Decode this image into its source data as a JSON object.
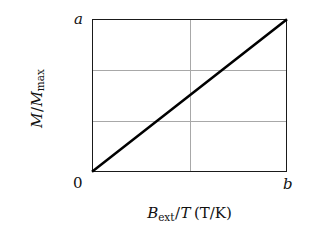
{
  "figure": {
    "name": "magnetization-vs-field-over-temperature-plot",
    "background_color": "#ffffff",
    "frame_color": "#1a1a1a",
    "grid_color": "#a8a8a8",
    "line_color": "#000000"
  },
  "axes": {
    "x": {
      "title_parts": {
        "symbol": "B",
        "subscript": "ext",
        "divider": "/",
        "denominator": "T",
        "units": "(T/K)"
      },
      "title_plain": "B_ext/T (T/K)",
      "tick_labels": [
        "0",
        "b"
      ],
      "tick_min": "0",
      "tick_max": "b"
    },
    "y": {
      "title_parts": {
        "numerator": "M",
        "divider": "/",
        "denominator": "M",
        "denominator_subscript": "max"
      },
      "title_plain": "M/M_max",
      "tick_labels": [
        "0",
        "a"
      ],
      "tick_min": "0",
      "tick_max": "a"
    }
  },
  "chart_data": {
    "type": "line",
    "title": "",
    "xlabel": "B_ext/T (T/K)",
    "ylabel": "M/M_max",
    "xlim": [
      0,
      1
    ],
    "ylim": [
      0,
      1
    ],
    "xtick_labels": [
      "0",
      "b"
    ],
    "ytick_labels": [
      "0",
      "a"
    ],
    "grid": true,
    "grid_x_fractions": [
      0.5
    ],
    "grid_y_fractions": [
      0.333,
      0.667
    ],
    "legend": null,
    "series": [
      {
        "name": "Curie law linear regime",
        "x": [
          0,
          1
        ],
        "y": [
          0,
          1
        ],
        "color": "#000000",
        "linewidth": 2.6,
        "style": "solid",
        "description": "straight proportional line from origin (0,0) to (b,a)"
      }
    ],
    "annotations": []
  }
}
